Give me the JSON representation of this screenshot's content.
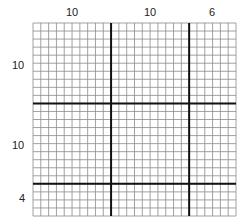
{
  "diagram": {
    "type": "area-model-grid",
    "columns": [
      {
        "label": "10",
        "units": 10
      },
      {
        "label": "10",
        "units": 10
      },
      {
        "label": "6",
        "units": 6
      }
    ],
    "rows": [
      {
        "label": "10",
        "units": 10
      },
      {
        "label": "10",
        "units": 10
      },
      {
        "label": "4",
        "units": 4
      }
    ],
    "total_columns": 26,
    "total_rows": 24
  },
  "colors": {
    "thin_line": "#8a8a8a",
    "thick_line": "#111111",
    "label": "#222222",
    "background": "#ffffff"
  }
}
